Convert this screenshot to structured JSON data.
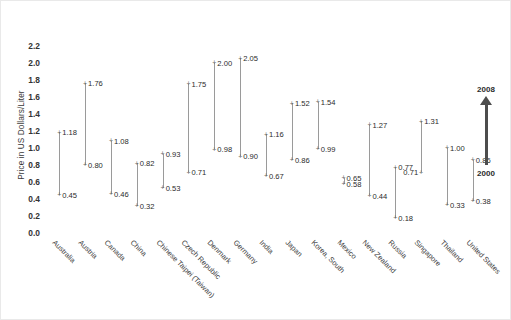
{
  "chart_data": {
    "type": "line",
    "title": "",
    "subtitle": "",
    "xlabel": "",
    "ylabel": "Price in US Dollars/Liter",
    "ylim": [
      0.0,
      2.3
    ],
    "ytick_labels": [
      "0.0",
      "0.2",
      "0.4",
      "0.6",
      "0.8",
      "1.0",
      "1.2",
      "1.4",
      "1.6",
      "1.8",
      "2.0",
      "2.2"
    ],
    "ytick_values": [
      0.0,
      0.2,
      0.4,
      0.6,
      0.8,
      1.0,
      1.2,
      1.4,
      1.6,
      1.8,
      2.0,
      2.2
    ],
    "grid": false,
    "legend_position": "right",
    "legend": {
      "top_label": "2008",
      "bottom_label": "2000",
      "arrow_direction": "up",
      "description": "Arrow pointing up from year 2000 to year 2008"
    },
    "categories": [
      "Australia",
      "Austria",
      "Canada",
      "China",
      "Chinese Taipei (Taiwan)",
      "Czech Republic",
      "Denmark",
      "Germany",
      "India",
      "Japan",
      "Korea, South",
      "Mexico",
      "New Zealand",
      "Russia",
      "Singapore",
      "Thailand",
      "United States"
    ],
    "series": [
      {
        "name": "2008",
        "values": [
          1.18,
          1.76,
          1.08,
          0.82,
          0.93,
          1.75,
          2.0,
          2.05,
          1.16,
          1.52,
          1.54,
          0.65,
          1.27,
          0.77,
          1.31,
          1.0,
          0.86
        ]
      },
      {
        "name": "2000",
        "values": [
          0.45,
          0.8,
          0.46,
          0.32,
          0.53,
          0.71,
          0.98,
          0.9,
          0.67,
          0.86,
          0.99,
          0.58,
          0.44,
          0.18,
          0.71,
          0.33,
          0.38
        ]
      }
    ],
    "point_labels": {
      "2008": [
        "1.18",
        "1.76",
        "1.08",
        "0.82",
        "0.93",
        "1.75",
        "2.00",
        "2.05",
        "1.16",
        "1.52",
        "1.54",
        "0.65",
        "1.27",
        "0.77",
        "1.31",
        "1.00",
        "0.86"
      ],
      "2000": [
        "0.45",
        "0.80",
        "0.46",
        "0.32",
        "0.53",
        "0.71",
        "0.98",
        "0.90",
        "0.67",
        "0.86",
        "0.99",
        "0.58",
        "0.44",
        "0.18",
        "0.71",
        "0.33",
        "0.38"
      ]
    },
    "label_side": {
      "2008": [
        "right",
        "right",
        "right",
        "right",
        "right",
        "right",
        "right",
        "right",
        "right",
        "right",
        "right",
        "right",
        "right",
        "right",
        "right",
        "right",
        "right"
      ],
      "2000": [
        "right",
        "right",
        "right",
        "right",
        "right",
        "right",
        "right",
        "right",
        "right",
        "right",
        "right",
        "right",
        "right",
        "right",
        "left",
        "right",
        "right"
      ]
    }
  }
}
